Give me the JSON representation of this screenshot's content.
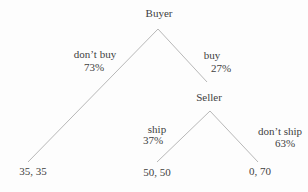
{
  "diagram": {
    "type": "game-tree",
    "nodes": {
      "buyer": {
        "label": "Buyer"
      },
      "seller": {
        "label": "Seller"
      }
    },
    "branches": {
      "dont_buy": {
        "label": "don’t buy",
        "prob": "73%"
      },
      "buy": {
        "label": "buy",
        "prob": "27%"
      },
      "ship": {
        "label": "ship",
        "prob": "37%"
      },
      "dont_ship": {
        "label": "don’t ship",
        "prob": "63%"
      }
    },
    "payoffs": {
      "dont_buy": "35, 35",
      "ship": "50, 50",
      "dont_ship": "0, 70"
    },
    "colors": {
      "edge": "#b8b8b8",
      "text": "#3f3f3f",
      "background": "#fdfdfd"
    }
  }
}
